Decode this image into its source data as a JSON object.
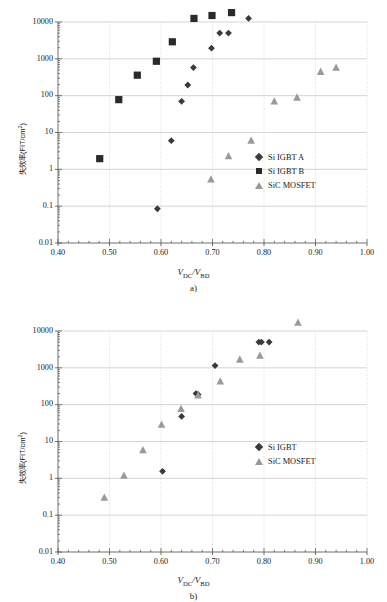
{
  "figure": {
    "width": 387,
    "height": 602,
    "background": "#ffffff"
  },
  "chart_data": [
    {
      "id": "a",
      "type": "scatter",
      "title": "",
      "caption": "a)",
      "xlabel": "V_DC/V_BD",
      "xlabel_parts": {
        "v1": "V",
        "sub1": "DC",
        "slash": "/",
        "v2": "V",
        "sub2": "BD"
      },
      "ylabel": "失效率(FIT/cm²)",
      "ylabel_parts": {
        "main": "失效率(FIT/cm",
        "sup": "2",
        "tail": ")"
      },
      "xlim": [
        0.4,
        1.0
      ],
      "xticks": [
        "0.40",
        "0.50",
        "0.60",
        "0.70",
        "0.80",
        "0.90",
        "1.00"
      ],
      "xtick_values": [
        0.4,
        0.5,
        0.6,
        0.7,
        0.8,
        0.9,
        1.0
      ],
      "yscale": "log",
      "ylim": [
        0.01,
        10000
      ],
      "yticks": [
        "10000",
        "1000",
        "100",
        "10",
        "1",
        "0.1",
        "0.01"
      ],
      "ytick_values": [
        10000,
        1000,
        100,
        10,
        1,
        0.1,
        0.01
      ],
      "grid": true,
      "legend_position": "right-lower",
      "series": [
        {
          "name": "Si IGBT A",
          "marker": "diamond",
          "color": "#3a3a3a",
          "points": [
            {
              "x": 0.593,
              "y": 0.085
            },
            {
              "x": 0.62,
              "y": 6.0
            },
            {
              "x": 0.64,
              "y": 70
            },
            {
              "x": 0.652,
              "y": 195
            },
            {
              "x": 0.663,
              "y": 580
            },
            {
              "x": 0.698,
              "y": 1950
            },
            {
              "x": 0.714,
              "y": 5000
            },
            {
              "x": 0.731,
              "y": 5000
            },
            {
              "x": 0.77,
              "y": 12500
            }
          ]
        },
        {
          "name": "Si IGBT B",
          "marker": "square",
          "color": "#2a2a2a",
          "points": [
            {
              "x": 0.481,
              "y": 1.95
            },
            {
              "x": 0.518,
              "y": 78
            },
            {
              "x": 0.554,
              "y": 360
            },
            {
              "x": 0.591,
              "y": 860
            },
            {
              "x": 0.622,
              "y": 2900
            },
            {
              "x": 0.664,
              "y": 12500
            },
            {
              "x": 0.699,
              "y": 15000
            },
            {
              "x": 0.737,
              "y": 18000
            }
          ]
        },
        {
          "name": "SiC MOSFET",
          "marker": "triangle",
          "color": "#9a9a9a",
          "points": [
            {
              "x": 0.697,
              "y": 0.54
            },
            {
              "x": 0.731,
              "y": 2.3
            },
            {
              "x": 0.775,
              "y": 6.1
            },
            {
              "x": 0.82,
              "y": 71
            },
            {
              "x": 0.864,
              "y": 90
            },
            {
              "x": 0.91,
              "y": 450
            },
            {
              "x": 0.94,
              "y": 580
            }
          ]
        }
      ]
    },
    {
      "id": "b",
      "type": "scatter",
      "title": "",
      "caption": "b)",
      "xlabel": "V_DC/V_BD",
      "xlabel_parts": {
        "v1": "V",
        "sub1": "DC",
        "slash": "/",
        "v2": "V",
        "sub2": "BD"
      },
      "ylabel": "失效率(FIT/cm²)",
      "ylabel_parts": {
        "main": "失效率(FIT/cm",
        "sup": "2",
        "tail": ")"
      },
      "xlim": [
        0.4,
        1.0
      ],
      "xticks": [
        "0.40",
        "0.50",
        "0.60",
        "0.70",
        "0.80",
        "0.90",
        "1.00"
      ],
      "xtick_values": [
        0.4,
        0.5,
        0.6,
        0.7,
        0.8,
        0.9,
        1.0
      ],
      "yscale": "log",
      "ylim": [
        0.01,
        10000
      ],
      "yticks": [
        "10000",
        "1000",
        "100",
        "10",
        "1",
        "0.1",
        "0.01"
      ],
      "ytick_values": [
        10000,
        1000,
        100,
        10,
        1,
        0.1,
        0.01
      ],
      "grid": true,
      "legend_position": "right-lower",
      "series": [
        {
          "name": "Si IGBT",
          "marker": "diamond",
          "color": "#3a3a3a",
          "points": [
            {
              "x": 0.603,
              "y": 1.55
            },
            {
              "x": 0.64,
              "y": 48
            },
            {
              "x": 0.668,
              "y": 200
            },
            {
              "x": 0.672,
              "y": 190
            },
            {
              "x": 0.705,
              "y": 1150
            },
            {
              "x": 0.79,
              "y": 5000
            },
            {
              "x": 0.795,
              "y": 5000
            },
            {
              "x": 0.81,
              "y": 5000
            }
          ]
        },
        {
          "name": "SiC MOSFET",
          "marker": "triangle",
          "color": "#9a9a9a",
          "points": [
            {
              "x": 0.49,
              "y": 0.3
            },
            {
              "x": 0.528,
              "y": 1.2
            },
            {
              "x": 0.565,
              "y": 5.9
            },
            {
              "x": 0.601,
              "y": 29
            },
            {
              "x": 0.639,
              "y": 78
            },
            {
              "x": 0.672,
              "y": 180
            },
            {
              "x": 0.715,
              "y": 430
            },
            {
              "x": 0.753,
              "y": 1700
            },
            {
              "x": 0.792,
              "y": 2150
            },
            {
              "x": 0.866,
              "y": 17000
            }
          ]
        }
      ]
    }
  ]
}
